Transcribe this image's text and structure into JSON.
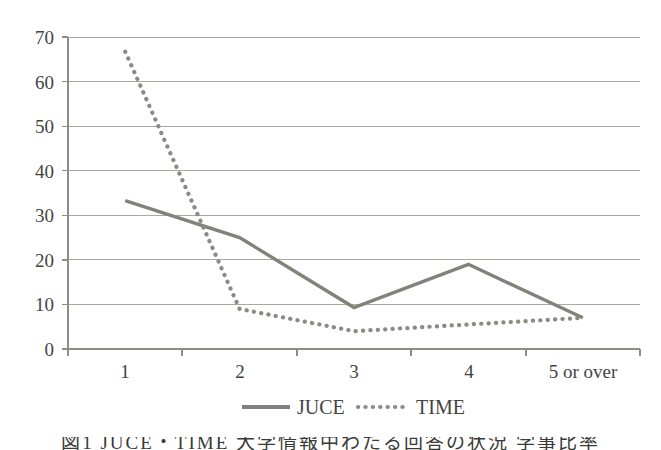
{
  "chart_data": {
    "type": "line",
    "title": "",
    "xlabel": "",
    "ylabel": "",
    "categories": [
      "1",
      "2",
      "3",
      "4",
      "5 or over"
    ],
    "yticks": [
      0,
      10,
      20,
      30,
      40,
      50,
      60,
      70
    ],
    "ylim": [
      0,
      70
    ],
    "grid": "horizontal",
    "legend_position": "bottom-center",
    "series": [
      {
        "name": "JUCE",
        "style": "solid",
        "color": "#82827a",
        "values": [
          33.3,
          25.0,
          9.3,
          19.0,
          7.0
        ]
      },
      {
        "name": "TIME",
        "style": "dotted",
        "color": "#8b8b82",
        "values": [
          66.7,
          9.0,
          4.0,
          5.5,
          7.0
        ]
      }
    ]
  },
  "axes": {
    "y_tick_labels": [
      "70",
      "60",
      "50",
      "40",
      "30",
      "20",
      "10",
      "0"
    ],
    "x_tick_labels": [
      "1",
      "2",
      "3",
      "4",
      "5 or over"
    ]
  },
  "legend": {
    "items": [
      {
        "label": "JUCE",
        "marker": "solid-line-swatch"
      },
      {
        "label": "TIME",
        "marker": "dotted-line-swatch"
      }
    ]
  },
  "caption": {
    "text": "図1 JUCE・TIME 大学情報中わたる回答の状況 学事比率"
  }
}
